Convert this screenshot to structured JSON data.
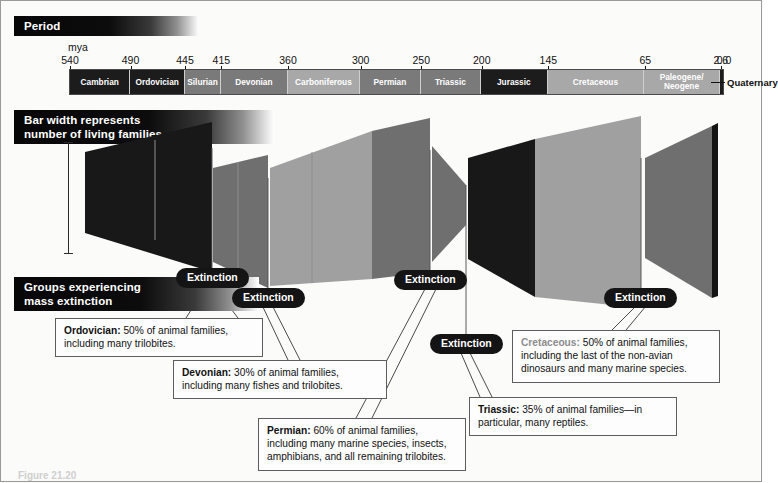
{
  "figure": {
    "period_banner": "Period",
    "bar_banner_line1": "Bar width represents",
    "bar_banner_line2": "number of living families",
    "groups_banner_line1": "Groups experiencing",
    "groups_banner_line2": "mass extinction",
    "axis_unit": "mya",
    "quaternary_label": "Quaternary",
    "caption": "Figure 21.20"
  },
  "axis": {
    "ticks": [
      "540",
      "490",
      "445",
      "415",
      "360",
      "300",
      "250",
      "200",
      "145",
      "65",
      "2.6",
      "0.0"
    ],
    "values": [
      540,
      490,
      445,
      415,
      360,
      300,
      250,
      200,
      145,
      65,
      2.6,
      0.0
    ]
  },
  "periods": [
    {
      "name": "Cambrian",
      "start": 540,
      "end": 490,
      "color": "#1c1c1c",
      "lines": 1
    },
    {
      "name": "Ordovician",
      "start": 490,
      "end": 445,
      "color": "#1c1c1c",
      "lines": 1
    },
    {
      "name": "Silurian",
      "start": 445,
      "end": 415,
      "color": "#7a7a7a",
      "lines": 1
    },
    {
      "name": "Devonian",
      "start": 415,
      "end": 360,
      "color": "#7a7a7a",
      "lines": 1
    },
    {
      "name": "Carboniferous",
      "start": 360,
      "end": 300,
      "color": "#a8a8a8",
      "lines": 1
    },
    {
      "name": "Permian",
      "start": 300,
      "end": 250,
      "color": "#7a7a7a",
      "lines": 1
    },
    {
      "name": "Triassic",
      "start": 250,
      "end": 200,
      "color": "#7a7a7a",
      "lines": 1
    },
    {
      "name": "Jurassic",
      "start": 200,
      "end": 145,
      "color": "#1c1c1c",
      "lines": 1
    },
    {
      "name": "Cretaceous",
      "start": 145,
      "end": 65,
      "color": "#a8a8a8",
      "lines": 1
    },
    {
      "name": "Paleogene/\nNeogene",
      "start": 65,
      "end": 2.6,
      "color": "#a8a8a8",
      "lines": 2
    },
    {
      "name": "",
      "start": 2.6,
      "end": 0.0,
      "color": "#1c1c1c",
      "lines": 1
    }
  ],
  "extinction_pills": [
    {
      "id": "ordovician",
      "label": "Extinction"
    },
    {
      "id": "devonian",
      "label": "Extinction"
    },
    {
      "id": "permian",
      "label": "Extinction"
    },
    {
      "id": "triassic",
      "label": "Extinction"
    },
    {
      "id": "cretaceous",
      "label": "Extinction"
    }
  ],
  "callouts": [
    {
      "id": "ordovician",
      "title": "Ordovician:",
      "body": " 50% of animal families, including many trilobites.",
      "title_style": "bold-dark"
    },
    {
      "id": "devonian",
      "title": "Devonian:",
      "body": " 30% of animal families, including many fishes and trilobites.",
      "title_style": "bold-dark"
    },
    {
      "id": "permian",
      "title": "Permian:",
      "body": " 60% of animal families, including many marine species, insects, amphibians, and all remaining trilobites.",
      "title_style": "bold-dark"
    },
    {
      "id": "triassic",
      "title": "Triassic:",
      "body": " 35% of animal families—in particular, many reptiles.",
      "title_style": "bold-dark"
    },
    {
      "id": "cretaceous",
      "title": "Cretaceous:",
      "body": " 50% of animal families, including the last of the non-avian dinosaurs and many marine species.",
      "title_style": "bold-gray"
    }
  ],
  "chart_data": {
    "type": "area",
    "xlabel": "mya",
    "ylabel": "number of living families",
    "segments": [
      {
        "period": "Cambrian-Ordovician",
        "shade": "#1c1c1c",
        "start_mya": 540,
        "end_mya": 445,
        "thickness_start": 0.62,
        "thickness_end": 1.0
      },
      {
        "period": "Silurian-Devonian",
        "shade": "#6f6f6f",
        "start_mya": 445,
        "end_mya": 360,
        "thickness_start": 0.52,
        "thickness_end": 0.6
      },
      {
        "period": "Carboniferous",
        "shade": "#a8a8a8",
        "start_mya": 360,
        "end_mya": 300,
        "thickness_start": 0.58,
        "thickness_end": 0.82
      },
      {
        "period": "Permian",
        "shade": "#6f6f6f",
        "start_mya": 300,
        "end_mya": 250,
        "thickness_start": 0.82,
        "thickness_end": 0.95
      },
      {
        "period": "Triassic",
        "shade": "#6f6f6f",
        "start_mya": 250,
        "end_mya": 200,
        "thickness_start": 0.3,
        "thickness_end": 0.58
      },
      {
        "period": "Jurassic",
        "shade": "#1c1c1c",
        "start_mya": 200,
        "end_mya": 145,
        "thickness_start": 0.62,
        "thickness_end": 0.86
      },
      {
        "period": "Cretaceous",
        "shade": "#a8a8a8",
        "start_mya": 145,
        "end_mya": 65,
        "thickness_start": 0.86,
        "thickness_end": 1.08
      },
      {
        "period": "Paleogene-Neogene",
        "shade": "#6f6f6f",
        "start_mya": 65,
        "end_mya": 0.0,
        "thickness_start": 0.55,
        "thickness_end": 1.14
      }
    ],
    "extinctions_mya": [
      445,
      360,
      250,
      200,
      65
    ]
  }
}
